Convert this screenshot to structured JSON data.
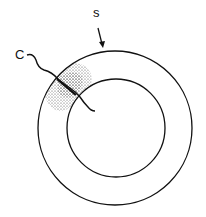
{
  "labels": {
    "s": "s",
    "c": "C"
  },
  "colors": {
    "stroke": "#111111",
    "stipple": "#333333"
  }
}
